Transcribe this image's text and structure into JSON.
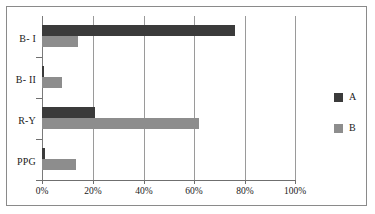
{
  "chart_data": {
    "type": "bar",
    "orientation": "horizontal",
    "title": "",
    "xlabel": "",
    "ylabel": "",
    "categories": [
      "B- I",
      "B- II",
      "R-Y",
      "PPG"
    ],
    "series": [
      {
        "name": "A",
        "color": "#3b3b3b",
        "values": [
          76,
          0.5,
          21,
          1
        ]
      },
      {
        "name": "B",
        "color": "#8d8d8d",
        "values": [
          14,
          8,
          62,
          13.5
        ]
      }
    ],
    "xlim": [
      0,
      100
    ],
    "xticks": [
      0,
      20,
      40,
      60,
      80,
      100
    ],
    "xtick_labels": [
      "0%",
      "20%",
      "40%",
      "60%",
      "80%",
      "100%"
    ],
    "grid": "vertical",
    "legend_position": "right",
    "legend_entries": [
      "A",
      "B"
    ]
  },
  "axis": {
    "tick_labels": [
      "0%",
      "20%",
      "40%",
      "60%",
      "80%",
      "100%"
    ],
    "category_labels": [
      "B- I",
      "B- II",
      "R-Y",
      "PPG"
    ]
  },
  "legend": {
    "items": [
      {
        "label": "A"
      },
      {
        "label": "B"
      }
    ]
  }
}
